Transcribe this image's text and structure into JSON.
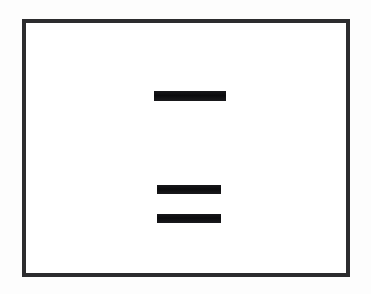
{
  "document": {
    "type": "scanned-page",
    "description": "Framed white document page with redacted text lines",
    "frame": {
      "border_color": "#2c2c2e",
      "border_width_px": 4,
      "background_color": "#ffffff",
      "x": 22,
      "y": 19,
      "width": 328,
      "height": 258
    },
    "page_background": "#fdfdfd"
  },
  "redactions": {
    "color": "#111113",
    "count": 3,
    "items": [
      {
        "id": "redaction-1",
        "label": "top redacted line",
        "content": "",
        "x": 150,
        "y": 87,
        "width": 72,
        "height": 10
      },
      {
        "id": "redaction-2",
        "label": "middle redacted line",
        "content": "",
        "x": 153,
        "y": 181,
        "width": 64,
        "height": 9
      },
      {
        "id": "redaction-3",
        "label": "bottom redacted line",
        "content": "",
        "x": 153,
        "y": 210,
        "width": 64,
        "height": 9
      }
    ]
  }
}
